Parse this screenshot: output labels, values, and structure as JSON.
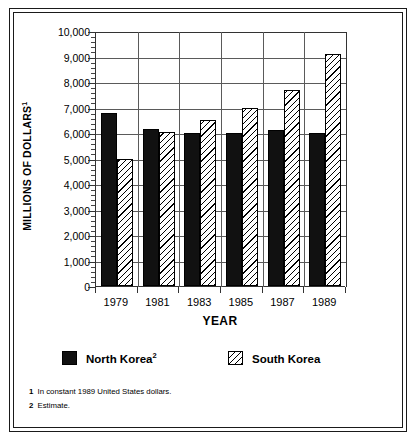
{
  "chart_data": {
    "type": "bar",
    "title": "",
    "xlabel": "YEAR",
    "ylabel": "MILLIONS OF DOLLARS",
    "ylabel_superscript": "1",
    "categories": [
      "1979",
      "1981",
      "1983",
      "1985",
      "1987",
      "1989"
    ],
    "series": [
      {
        "name": "North Korea",
        "name_superscript": "2",
        "fill": "solid-black",
        "color": "#111111",
        "values": [
          6800,
          6150,
          6000,
          6000,
          6100,
          6000
        ]
      },
      {
        "name": "South Korea",
        "name_superscript": "",
        "fill": "diagonal-hatch",
        "color": "#ffffff",
        "values": [
          5000,
          6050,
          6500,
          7000,
          7700,
          9100
        ]
      }
    ],
    "ylim": [
      0,
      10000
    ],
    "ytick_values": [
      0,
      1000,
      2000,
      3000,
      4000,
      5000,
      6000,
      7000,
      8000,
      9000,
      10000
    ],
    "ytick_labels": [
      "0",
      "1,000",
      "2,000",
      "3,000",
      "4,000",
      "5,000",
      "6,000",
      "7,000",
      "8,000",
      "9,000",
      "10,000"
    ],
    "y_minor_ticks_per_interval": 4,
    "grid": "both",
    "legend_position": "bottom"
  },
  "legend": {
    "items": [
      {
        "label": "North Korea",
        "superscript": "2",
        "swatch": "solid-black-swatch"
      },
      {
        "label": "South Korea",
        "superscript": "",
        "swatch": "hatched-swatch"
      }
    ]
  },
  "footnotes": [
    {
      "marker": "1",
      "text": "In constant 1989 United States dollars."
    },
    {
      "marker": "2",
      "text": "Estimate."
    }
  ]
}
